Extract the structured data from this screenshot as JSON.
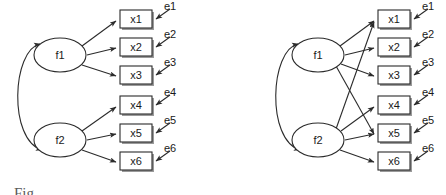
{
  "figure": {
    "background_color": "#ffffff",
    "stroke_color": "#2b2b2b",
    "width": 446,
    "height": 195,
    "panels": [
      {
        "id": "left-panel",
        "name": "simple-structure-model",
        "origin_x": 0,
        "factors": [
          {
            "id": "f1",
            "label": "f1",
            "cx": 60,
            "cy": 55,
            "rx": 26,
            "ry": 17
          },
          {
            "id": "f2",
            "label": "f2",
            "cx": 60,
            "cy": 140,
            "rx": 26,
            "ry": 17
          }
        ],
        "indicators": [
          {
            "id": "x1",
            "label": "x1",
            "x": 120,
            "y": 10
          },
          {
            "id": "x2",
            "label": "x2",
            "x": 120,
            "y": 38
          },
          {
            "id": "x3",
            "label": "x3",
            "x": 120,
            "y": 66
          },
          {
            "id": "x4",
            "label": "x4",
            "x": 120,
            "y": 96
          },
          {
            "id": "x5",
            "label": "x5",
            "x": 120,
            "y": 124
          },
          {
            "id": "x6",
            "label": "x6",
            "x": 120,
            "y": 152
          }
        ],
        "errors": [
          {
            "id": "e1",
            "label": "e1",
            "x": 166,
            "y": 8
          },
          {
            "id": "e2",
            "label": "e2",
            "x": 166,
            "y": 36
          },
          {
            "id": "e3",
            "label": "e3",
            "x": 166,
            "y": 64
          },
          {
            "id": "e4",
            "label": "e4",
            "x": 166,
            "y": 94
          },
          {
            "id": "e5",
            "label": "e5",
            "x": 166,
            "y": 122
          },
          {
            "id": "e6",
            "label": "e6",
            "x": 166,
            "y": 150
          }
        ],
        "loadings": [
          {
            "from": "f1",
            "to": "x1"
          },
          {
            "from": "f1",
            "to": "x2"
          },
          {
            "from": "f1",
            "to": "x3"
          },
          {
            "from": "f2",
            "to": "x4"
          },
          {
            "from": "f2",
            "to": "x5"
          },
          {
            "from": "f2",
            "to": "x6"
          }
        ],
        "covariance": {
          "between": [
            "f1",
            "f2"
          ],
          "double_headed": true
        }
      },
      {
        "id": "right-panel",
        "name": "cross-loading-model",
        "origin_x": 258,
        "factors": [
          {
            "id": "f1",
            "label": "f1",
            "cx": 60,
            "cy": 55,
            "rx": 26,
            "ry": 17
          },
          {
            "id": "f2",
            "label": "f2",
            "cx": 60,
            "cy": 140,
            "rx": 26,
            "ry": 17
          }
        ],
        "indicators": [
          {
            "id": "x1",
            "label": "x1",
            "x": 120,
            "y": 10
          },
          {
            "id": "x2",
            "label": "x2",
            "x": 120,
            "y": 38
          },
          {
            "id": "x3",
            "label": "x3",
            "x": 120,
            "y": 66
          },
          {
            "id": "x4",
            "label": "x4",
            "x": 120,
            "y": 96
          },
          {
            "id": "x5",
            "label": "x5",
            "x": 120,
            "y": 124
          },
          {
            "id": "x6",
            "label": "x6",
            "x": 120,
            "y": 152
          }
        ],
        "errors": [
          {
            "id": "e1",
            "label": "e1",
            "x": 166,
            "y": 8
          },
          {
            "id": "e2",
            "label": "e2",
            "x": 166,
            "y": 36
          },
          {
            "id": "e3",
            "label": "e3",
            "x": 166,
            "y": 64
          },
          {
            "id": "e4",
            "label": "e4",
            "x": 166,
            "y": 94
          },
          {
            "id": "e5",
            "label": "e5",
            "x": 166,
            "y": 122
          },
          {
            "id": "e6",
            "label": "e6",
            "x": 166,
            "y": 150
          }
        ],
        "loadings": [
          {
            "from": "f1",
            "to": "x1"
          },
          {
            "from": "f1",
            "to": "x2"
          },
          {
            "from": "f1",
            "to": "x3"
          },
          {
            "from": "f1",
            "to": "x5"
          },
          {
            "from": "f2",
            "to": "x1"
          },
          {
            "from": "f2",
            "to": "x4"
          },
          {
            "from": "f2",
            "to": "x5"
          },
          {
            "from": "f2",
            "to": "x6"
          }
        ],
        "covariance": {
          "between": [
            "f1",
            "f2"
          ],
          "double_headed": true
        }
      }
    ],
    "cut_off_caption": "Fig"
  }
}
